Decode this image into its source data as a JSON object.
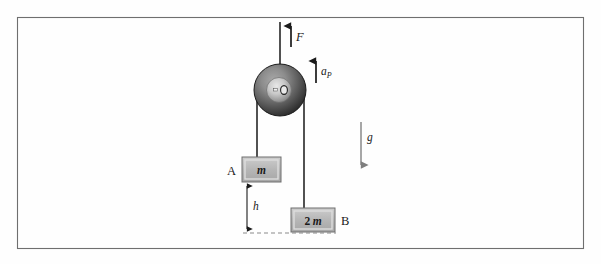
{
  "figure": {
    "frame": {
      "border_color": "#6e6e6e",
      "background": "#fefefe"
    },
    "labels": {
      "applied_force": "F",
      "pulley_acceleration_base": "a",
      "pulley_acceleration_subscript": "P",
      "gravity": "g",
      "block_a_name": "A",
      "block_a_mass": "m",
      "block_b_name": "B",
      "block_b_mass_coefficient": "2",
      "block_b_mass_symbol": "m",
      "height_label": "h"
    },
    "colors": {
      "rope": "#262626",
      "arrow": "#1a1a1a",
      "block_fill": "#b4b4b4",
      "block_edge_light": "#e2e2e2",
      "block_edge_dark": "#7a7a7a",
      "pulley_rim_dark": "#2d2d2d",
      "pulley_mid": "#8c8c8c",
      "pulley_light": "#d6d6d6",
      "gravity_arrow": "#8a8a8a",
      "dashed_line": "#8a8a8a"
    },
    "geometry": {
      "pulley_center_x": 280,
      "pulley_center_y": 90,
      "pulley_radius": 26,
      "rope_left_x": 257,
      "rope_right_x": 304,
      "block_a_x": 242,
      "block_a_y": 157,
      "block_a_w": 39,
      "block_a_h": 25,
      "block_b_x": 291,
      "block_b_y": 208,
      "block_b_w": 44,
      "block_b_h": 24,
      "dashed_y": 233,
      "h_line_x": 247
    }
  }
}
